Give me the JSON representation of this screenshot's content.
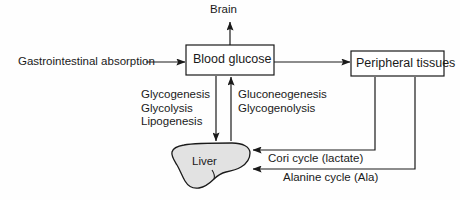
{
  "diagram": {
    "colors": {
      "background": "#fefefe",
      "stroke": "#1a1a1a",
      "text": "#1a1a1a",
      "liver_fill": "#e2e2e2",
      "box_fill": "#ffffff"
    },
    "nodes": {
      "brain": {
        "label": "Brain"
      },
      "blood_glucose": {
        "label": "Blood glucose"
      },
      "peripheral_tissues": {
        "label": "Peripheral tissues"
      },
      "gastrointestinal_absorption": {
        "label": "Gastrointestinal absorption"
      },
      "liver": {
        "label": "Liver"
      }
    },
    "pathways": {
      "to_liver": {
        "lines": [
          "Glycogenesis",
          "Glycolysis",
          "Lipogenesis"
        ]
      },
      "from_liver": {
        "lines": [
          "Gluconeogenesis",
          "Glycogenolysis"
        ]
      }
    },
    "cycles": {
      "cori": {
        "label": "Cori cycle (lactate)"
      },
      "alanine": {
        "label": "Alanine cycle (Ala)"
      }
    }
  }
}
